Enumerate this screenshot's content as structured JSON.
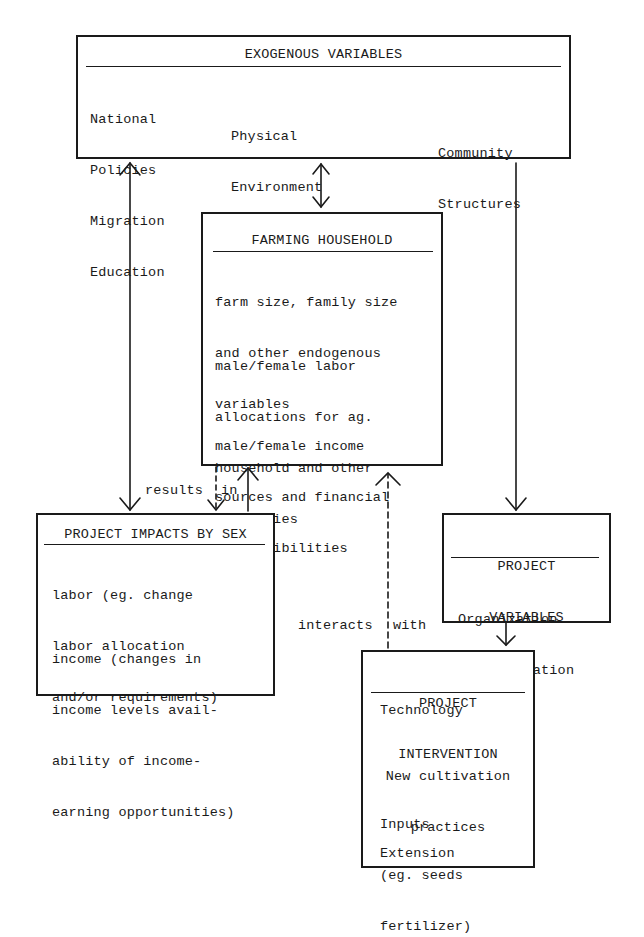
{
  "diagram": {
    "exogenous": {
      "title": "EXOGENOUS VARIABLES",
      "col1": [
        "National",
        "Policies",
        "Migration",
        "Education"
      ],
      "col2": [
        "Physical",
        "Environment",
        "Cultural Norms"
      ],
      "col3": [
        "Community",
        "Structures"
      ]
    },
    "household": {
      "title": "FARMING HOUSEHOLD",
      "p1": [
        "farm size, family size",
        "and other endogenous",
        "variables"
      ],
      "p2": [
        "male/female labor",
        "allocations for ag.",
        "household and other",
        "activities"
      ],
      "p3": [
        "male/female income",
        "sources and financial",
        "responsibilities"
      ]
    },
    "impacts": {
      "title": "PROJECT IMPACTS BY SEX",
      "p1": [
        "labor (eg. change",
        "labor allocation",
        "and/or requirements)"
      ],
      "p2": [
        "income (changes in",
        "income levels avail-",
        "ability of income-",
        "earning opportunities)"
      ]
    },
    "project_variables": {
      "title_line1": "PROJECT",
      "title_line2": "VARIABLES",
      "items": [
        "Organization",
        "Administration"
      ]
    },
    "intervention": {
      "title_line1": "PROJECT",
      "title_line2": "INTERVENTION",
      "technology": "Technology",
      "cultivation": [
        "New cultivation",
        "practices"
      ],
      "inputs": [
        "Inputs",
        "(eg. seeds",
        "fertilizer)"
      ],
      "extension": "Extension"
    },
    "edge_labels": {
      "results_left": "results",
      "results_right": "in",
      "interacts_left": "interacts",
      "interacts_right": "with"
    },
    "edges": [
      {
        "from": "exogenous",
        "to": "impacts",
        "style": "solid",
        "direction": "both"
      },
      {
        "from": "exogenous",
        "to": "household",
        "style": "solid",
        "direction": "both"
      },
      {
        "from": "exogenous",
        "to": "project_variables",
        "style": "solid",
        "direction": "forward"
      },
      {
        "from": "household",
        "to": "impacts",
        "style": "dashed",
        "direction": "forward",
        "label": "results in"
      },
      {
        "from": "impacts",
        "to": "household",
        "style": "solid",
        "direction": "forward"
      },
      {
        "from": "intervention",
        "to": "household",
        "style": "dashed",
        "direction": "forward",
        "label": "interacts with"
      },
      {
        "from": "project_variables",
        "to": "intervention",
        "style": "solid",
        "direction": "forward"
      }
    ]
  }
}
